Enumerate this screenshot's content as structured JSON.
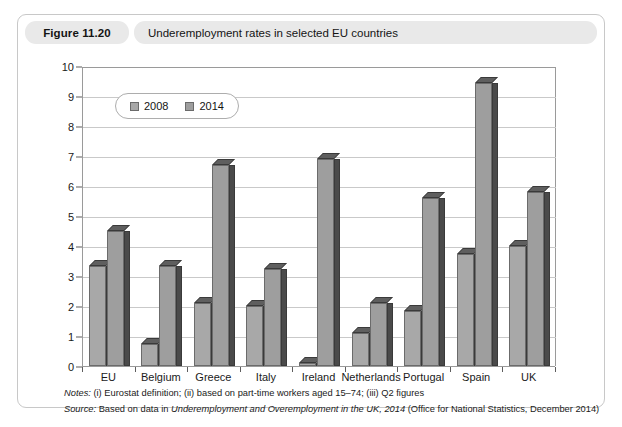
{
  "figure": {
    "number": "Figure 11.20",
    "title": "Underemployment rates in selected EU countries"
  },
  "notes": {
    "notes_lead": "Notes:",
    "notes_text": " (i) Eurostat definition; (ii) based on part-time workers aged 15–74; (iii) Q2 figures",
    "source_lead": "Source:",
    "source_text_a": " Based on data in ",
    "source_italic": "Underemployment and Overemployment in the UK, 2014",
    "source_text_b": " (Office for National Statistics, December 2014)"
  },
  "chart_data": {
    "type": "bar",
    "title": "Underemployment rates in selected EU countries",
    "xlabel": "",
    "ylabel": "",
    "ylim": [
      0,
      10
    ],
    "yticks": [
      0,
      1,
      2,
      3,
      4,
      5,
      6,
      7,
      8,
      9,
      10
    ],
    "grid": true,
    "legend_position": "top-left",
    "categories": [
      "EU",
      "Belgium",
      "Greece",
      "Italy",
      "Ireland",
      "Netherlands",
      "Portugal",
      "Spain",
      "UK"
    ],
    "series": [
      {
        "name": "2008",
        "color": "#a8a8a8",
        "values": [
          3.35,
          0.75,
          2.1,
          2.0,
          0.1,
          1.1,
          1.85,
          3.75,
          4.0
        ]
      },
      {
        "name": "2014",
        "color": "#9e9e9e",
        "values": [
          4.5,
          3.35,
          6.7,
          3.25,
          6.9,
          2.1,
          5.6,
          9.45,
          5.8
        ]
      }
    ]
  }
}
